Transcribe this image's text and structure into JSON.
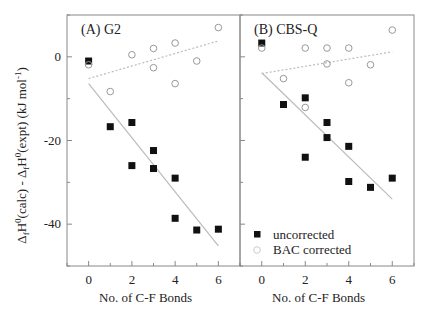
{
  "chart_data": [
    {
      "type": "scatter",
      "panel_title": "(A)  G2",
      "xlabel": "No. of C-F Bonds",
      "ylabel": "ΔfH0(calc) - ΔfH0(expt) (kJ mol-1)",
      "xlim": [
        -1,
        7
      ],
      "ylim": [
        -50,
        10
      ],
      "xticks": [
        0,
        2,
        4,
        6
      ],
      "yticks": [
        0,
        -20,
        -40
      ],
      "grid": false,
      "series": [
        {
          "name": "uncorrected",
          "marker": "filled-square",
          "points": [
            [
              0,
              -1
            ],
            [
              1,
              -16.7
            ],
            [
              2,
              -15.7
            ],
            [
              2,
              -26
            ],
            [
              3,
              -22.4
            ],
            [
              3,
              -26.7
            ],
            [
              4,
              -29
            ],
            [
              4,
              -38.6
            ],
            [
              5,
              -41.4
            ],
            [
              6,
              -41.2
            ]
          ]
        },
        {
          "name": "BAC corrected",
          "marker": "open-circle",
          "points": [
            [
              0,
              -1.9
            ],
            [
              1,
              -8.3
            ],
            [
              2,
              0.5
            ],
            [
              3,
              2
            ],
            [
              3,
              -2.6
            ],
            [
              4,
              3.3
            ],
            [
              4,
              -6.4
            ],
            [
              5,
              -1
            ],
            [
              6,
              7
            ]
          ]
        }
      ],
      "fit_lines": [
        {
          "series": "uncorrected",
          "style": "solid",
          "from": [
            0,
            -6.4
          ],
          "to": [
            6,
            -45.2
          ]
        },
        {
          "series": "BAC corrected",
          "style": "dotted",
          "from": [
            0,
            -5.2
          ],
          "to": [
            6,
            3.8
          ]
        }
      ]
    },
    {
      "type": "scatter",
      "panel_title": "(B)  CBS-Q",
      "xlabel": "No. of C-F Bonds",
      "xlim": [
        -1,
        7
      ],
      "ylim": [
        -50,
        10
      ],
      "xticks": [
        0,
        2,
        4,
        6
      ],
      "grid": false,
      "legend": {
        "position": "lower left",
        "entries": [
          "uncorrected",
          "BAC corrected"
        ]
      },
      "series": [
        {
          "name": "uncorrected",
          "marker": "filled-square",
          "points": [
            [
              0,
              3.3
            ],
            [
              1,
              -11.4
            ],
            [
              2,
              -9.8
            ],
            [
              2,
              -24
            ],
            [
              3,
              -15.7
            ],
            [
              3,
              -19.3
            ],
            [
              4,
              -21.4
            ],
            [
              4,
              -29.8
            ],
            [
              5,
              -31.2
            ],
            [
              6,
              -29
            ]
          ]
        },
        {
          "name": "BAC corrected",
          "marker": "open-circle",
          "points": [
            [
              0,
              2.1
            ],
            [
              1,
              -5.2
            ],
            [
              2,
              2.1
            ],
            [
              2,
              -12.1
            ],
            [
              3,
              2.1
            ],
            [
              3,
              -1.7
            ],
            [
              4,
              2.1
            ],
            [
              4,
              -6.2
            ],
            [
              5,
              -1.9
            ],
            [
              6,
              6.4
            ]
          ]
        }
      ],
      "fit_lines": [
        {
          "series": "uncorrected",
          "style": "solid",
          "from": [
            0,
            -3.8
          ],
          "to": [
            6,
            -34
          ]
        },
        {
          "series": "BAC corrected",
          "style": "dotted",
          "from": [
            0,
            -4
          ],
          "to": [
            6,
            1.2
          ]
        }
      ]
    }
  ],
  "labels": {
    "ylabel_main": "ΔfH0(calc) - ΔfH0(expt) (kJ mol-1)",
    "xlabel_a": "No. of C-F Bonds",
    "xlabel_b": "No. of C-F Bonds",
    "legend_uncorrected": "uncorrected",
    "legend_bac": "BAC corrected"
  },
  "colors": {
    "axis": "#888888",
    "square": "#111111",
    "circle": "#999999",
    "line": "#bbbbbb",
    "text": "#222222"
  }
}
